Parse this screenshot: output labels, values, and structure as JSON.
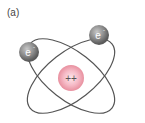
{
  "figure": {
    "panel_label": "(a)",
    "nucleus": {
      "label": "++",
      "color": "#f2a9b8"
    },
    "electrons": [
      {
        "label": "e",
        "superscript": "-"
      },
      {
        "label": "e",
        "superscript": "-"
      }
    ],
    "orbit_color": "#555555"
  }
}
